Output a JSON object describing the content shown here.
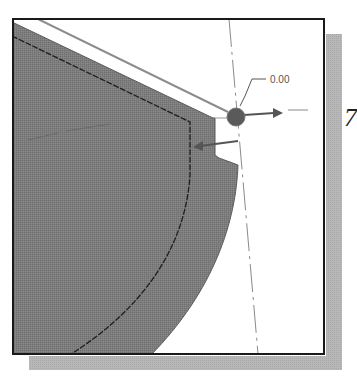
{
  "figure": {
    "dimension_label": "0.00",
    "step_number": "7",
    "colors": {
      "background": "#ffffff",
      "frame_border": "#1a1a1a",
      "shadow": "#b3b3b3",
      "solid_fill": "#7d7d7d",
      "solid_edge": "#555555",
      "contour_line": "#1e1e1e",
      "centerline": "#8a8a8a",
      "handle": "#555555",
      "label_text": "#555555"
    }
  }
}
